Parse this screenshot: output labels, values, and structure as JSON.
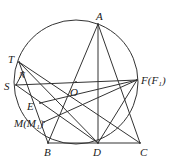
{
  "diagram": {
    "circle_center": "O",
    "points": {
      "A": "A",
      "T": "T",
      "N": "N",
      "S": "S",
      "O": "O",
      "F": "F(F₁)",
      "E": "E",
      "M": "M(M₁)",
      "B": "B",
      "D": "D",
      "C": "C"
    },
    "segments": [
      [
        "A",
        "B"
      ],
      [
        "A",
        "C"
      ],
      [
        "A",
        "D"
      ],
      [
        "S",
        "F"
      ],
      [
        "T",
        "C"
      ],
      [
        "T",
        "D"
      ],
      [
        "S",
        "D"
      ],
      [
        "S",
        "N"
      ],
      [
        "T",
        "B"
      ],
      [
        "E",
        "F"
      ],
      [
        "M",
        "F"
      ],
      [
        "D",
        "F"
      ],
      [
        "B",
        "C"
      ]
    ]
  }
}
